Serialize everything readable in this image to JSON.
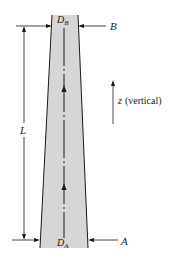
{
  "diagram": {
    "labels": {
      "top_diameter": "D",
      "top_diameter_sub": "B",
      "bottom_diameter": "D",
      "bottom_diameter_sub": "A",
      "section_top": "B",
      "section_bottom": "A",
      "length": "L",
      "axis_var": "z",
      "axis_note": "(vertical)"
    },
    "colors": {
      "tube_fill": "#d6d6d6",
      "line": "#1a1a1a",
      "centerline_gap": "#ffffff"
    }
  }
}
